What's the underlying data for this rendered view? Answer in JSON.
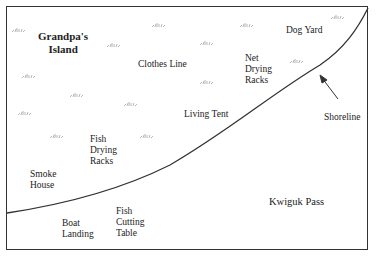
{
  "map": {
    "title": "Grandpa's\nIsland",
    "labels": {
      "clothes_line": "Clothes Line",
      "dog_yard": "Dog Yard",
      "net_drying_racks": "Net\nDrying\nRacks",
      "living_tent": "Living Tent",
      "shoreline": "Shoreline",
      "fish_drying_racks": "Fish\nDrying\nRacks",
      "smoke_house": "Smoke\nHouse",
      "boat_landing": "Boat\nLanding",
      "fish_cutting_table": "Fish\nCutting\nTable",
      "kwiguk_pass": "Kwiguk Pass"
    },
    "grass_symbol": "\\\\|//",
    "colors": {
      "line": "#333333",
      "grass": "#999999",
      "background": "#ffffff"
    }
  }
}
